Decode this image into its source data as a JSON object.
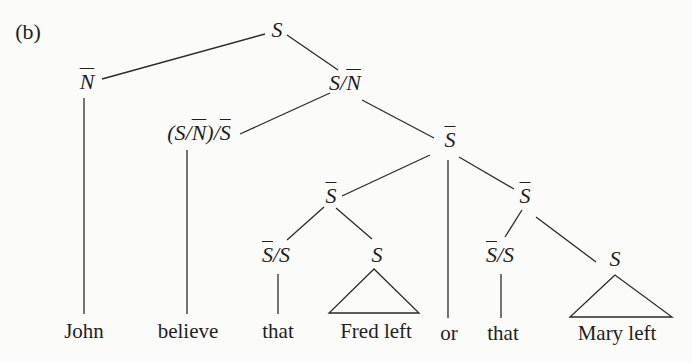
{
  "panel_label": "(b)",
  "nodes": {
    "root": "S",
    "np_subject": "N",
    "vp": "S/N",
    "verb_cat_a": "(S/",
    "verb_cat_n": "N",
    "verb_cat_b": ")/",
    "verb_cat_s": "S",
    "sbar_top": "S",
    "sbar_left": "S",
    "sbar_right": "S",
    "comp_left_bar": "S",
    "comp_left_rest": "/S",
    "s_left": "S",
    "comp_right_bar": "S",
    "comp_right_rest": "/S",
    "s_right": "S"
  },
  "leaves": [
    "John",
    "believe",
    "that",
    "Fred left",
    "or",
    "that",
    "Mary left"
  ],
  "tree": {
    "label": "S",
    "children": [
      {
        "label": "N̄",
        "children": [
          {
            "label": "John"
          }
        ]
      },
      {
        "label": "S/N̄",
        "children": [
          {
            "label": "(S/N̄)/S̄",
            "children": [
              {
                "label": "believe"
              }
            ]
          },
          {
            "label": "S̄",
            "children": [
              {
                "label": "S̄",
                "children": [
                  {
                    "label": "S̄/S",
                    "children": [
                      {
                        "label": "that"
                      }
                    ]
                  },
                  {
                    "label": "S",
                    "children": [
                      {
                        "label": "Fred left",
                        "triangle": true
                      }
                    ]
                  }
                ]
              },
              {
                "label": "or"
              },
              {
                "label": "S̄",
                "children": [
                  {
                    "label": "S̄/S",
                    "children": [
                      {
                        "label": "that"
                      }
                    ]
                  },
                  {
                    "label": "S",
                    "children": [
                      {
                        "label": "Mary left",
                        "triangle": true
                      }
                    ]
                  }
                ]
              }
            ]
          }
        ]
      }
    ]
  }
}
